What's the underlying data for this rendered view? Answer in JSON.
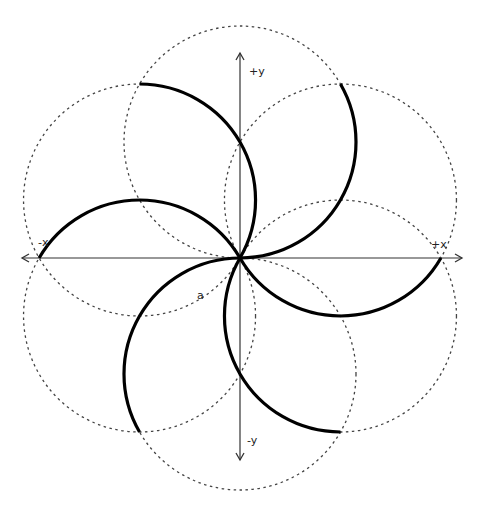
{
  "diagram": {
    "title": "",
    "axes": {
      "x_positive_label": "+x",
      "x_negative_label": "-x",
      "y_positive_label": "+y",
      "y_negative_label": "-y"
    },
    "annotation_label": "a",
    "circle_count": 6,
    "circle_center_angles_deg": [
      30,
      90,
      150,
      210,
      270,
      330
    ],
    "arc_endpoint_angles_deg": [
      0,
      60,
      120,
      180,
      240,
      300
    ],
    "colors": {
      "background": "#ffffff",
      "axis": "#333333",
      "dotted_circle": "#444444",
      "heavy_arc": "#000000"
    }
  }
}
